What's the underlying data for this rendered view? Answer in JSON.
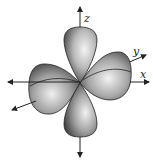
{
  "diagram": {
    "axes": [
      {
        "name": "z",
        "label": "z"
      },
      {
        "name": "y",
        "label": "y"
      },
      {
        "name": "x",
        "label": "x"
      }
    ],
    "colors": {
      "lobe_light": "#f2f2f2",
      "lobe_mid": "#a8a8a8",
      "lobe_dark": "#3a3a3a",
      "axis": "#222222",
      "background": "#ffffff"
    }
  }
}
